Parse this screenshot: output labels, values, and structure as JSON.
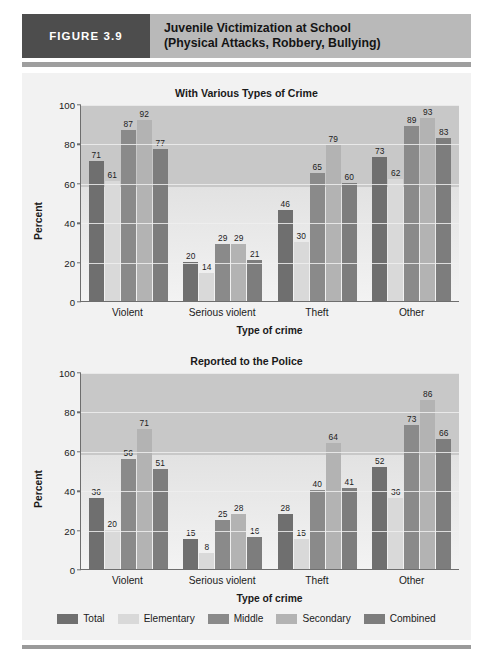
{
  "figure": {
    "tag": "FIGURE 3.9",
    "title_line1": "Juvenile Victimization at School",
    "title_line2": "(Physical Attacks, Robbery, Bullying)",
    "tag_bg": "#4d4d4d",
    "header_bg": "#b9b9b9",
    "panel_bg": "#f2f2f2"
  },
  "series_colors": {
    "Total": "#6f6f6f",
    "Elementary": "#d9d9d9",
    "Middle": "#8a8a8a",
    "Secondary": "#b3b3b3",
    "Combined": "#7d7d7d"
  },
  "legend": {
    "items": [
      {
        "label": "Total",
        "color": "#6f6f6f"
      },
      {
        "label": "Elementary",
        "color": "#d9d9d9"
      },
      {
        "label": "Middle",
        "color": "#8a8a8a"
      },
      {
        "label": "Secondary",
        "color": "#b3b3b3"
      },
      {
        "label": "Combined",
        "color": "#7d7d7d"
      }
    ]
  },
  "chart_data": [
    {
      "type": "bar",
      "title": "With Various Types of Crime",
      "xlabel": "Type of crime",
      "ylabel": "Percent",
      "ylim": [
        0,
        100
      ],
      "yticks": [
        0,
        20,
        40,
        60,
        80,
        100
      ],
      "grid": true,
      "legend_position": "bottom",
      "categories": [
        "Violent",
        "Serious violent",
        "Theft",
        "Other"
      ],
      "series": [
        {
          "name": "Total",
          "values": [
            71,
            20,
            46,
            73
          ]
        },
        {
          "name": "Elementary",
          "values": [
            61,
            14,
            30,
            62
          ]
        },
        {
          "name": "Middle",
          "values": [
            87,
            29,
            65,
            89
          ]
        },
        {
          "name": "Secondary",
          "values": [
            92,
            29,
            79,
            93
          ]
        },
        {
          "name": "Combined",
          "values": [
            77,
            21,
            60,
            83
          ]
        }
      ]
    },
    {
      "type": "bar",
      "title": "Reported to the Police",
      "xlabel": "Type of crime",
      "ylabel": "Percent",
      "ylim": [
        0,
        100
      ],
      "yticks": [
        0,
        20,
        40,
        60,
        80,
        100
      ],
      "grid": true,
      "legend_position": "bottom",
      "categories": [
        "Violent",
        "Serious violent",
        "Theft",
        "Other"
      ],
      "series": [
        {
          "name": "Total",
          "values": [
            36,
            15,
            28,
            52
          ]
        },
        {
          "name": "Elementary",
          "values": [
            20,
            8,
            15,
            36
          ]
        },
        {
          "name": "Middle",
          "values": [
            56,
            25,
            40,
            73
          ]
        },
        {
          "name": "Secondary",
          "values": [
            71,
            28,
            64,
            86
          ]
        },
        {
          "name": "Combined",
          "values": [
            51,
            16,
            41,
            66
          ]
        }
      ]
    }
  ]
}
